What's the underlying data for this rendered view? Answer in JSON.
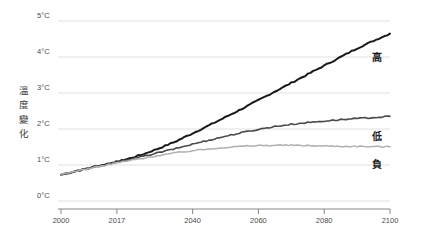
{
  "chart_data": {
    "type": "line",
    "title": "",
    "subtitle": "",
    "xlabel": "",
    "ylabel": "溫度變化",
    "ylabel_chars": [
      "溫",
      "度",
      "變",
      "化"
    ],
    "xlim": [
      2000,
      2100
    ],
    "ylim": [
      0,
      5
    ],
    "y_unit": "°C",
    "grid": true,
    "grid_axis": "y",
    "legend_position": "right-inline",
    "y_ticks": [
      0,
      1,
      2,
      3,
      4,
      5
    ],
    "y_tick_labels": [
      "0°C",
      "1°C",
      "2°C",
      "3°C",
      "4°C",
      "5°C"
    ],
    "x_ticks": [
      2000,
      2017,
      2040,
      2060,
      2080,
      2100
    ],
    "x_tick_labels": [
      "2000",
      "2017",
      "2040",
      "2060",
      "2080",
      "2100"
    ],
    "x": [
      2000,
      2005,
      2010,
      2015,
      2017,
      2020,
      2025,
      2030,
      2035,
      2040,
      2045,
      2050,
      2055,
      2060,
      2065,
      2070,
      2075,
      2080,
      2085,
      2090,
      2095,
      2100
    ],
    "series": [
      {
        "name": "高",
        "label": "高",
        "color": "#1a1a1a",
        "width": 2.0,
        "values": [
          0.73,
          0.84,
          0.95,
          1.05,
          1.09,
          1.16,
          1.3,
          1.47,
          1.66,
          1.88,
          2.1,
          2.33,
          2.56,
          2.8,
          3.04,
          3.28,
          3.52,
          3.76,
          4.0,
          4.24,
          4.45,
          4.65
        ]
      },
      {
        "name": "低",
        "label": "低",
        "color": "#4a4a4a",
        "width": 1.6,
        "values": [
          0.73,
          0.84,
          0.94,
          1.04,
          1.08,
          1.14,
          1.24,
          1.35,
          1.46,
          1.58,
          1.69,
          1.8,
          1.9,
          1.99,
          2.07,
          2.13,
          2.18,
          2.22,
          2.26,
          2.29,
          2.32,
          2.35
        ]
      },
      {
        "name": "負",
        "label": "負",
        "color": "#b0b0b0",
        "width": 1.5,
        "values": [
          0.73,
          0.84,
          0.93,
          1.02,
          1.06,
          1.11,
          1.19,
          1.27,
          1.34,
          1.4,
          1.45,
          1.49,
          1.52,
          1.54,
          1.55,
          1.55,
          1.54,
          1.53,
          1.52,
          1.52,
          1.51,
          1.51
        ]
      }
    ],
    "series_label_positions": [
      {
        "label": "高",
        "x": 2103,
        "y": 4.05
      },
      {
        "label": "低",
        "x": 2103,
        "y": 1.85
      },
      {
        "label": "負",
        "x": 2103,
        "y": 1.08
      }
    ]
  },
  "colors": {
    "background": "#ffffff",
    "grid": "#d9d9d9",
    "axis": "#7a7a7a",
    "tick_text": "#4a4a4a",
    "label_text": "#3a3a3a",
    "high_series": "#1a1a1a",
    "low_series": "#4a4a4a",
    "negative_series": "#b0b0b0"
  }
}
